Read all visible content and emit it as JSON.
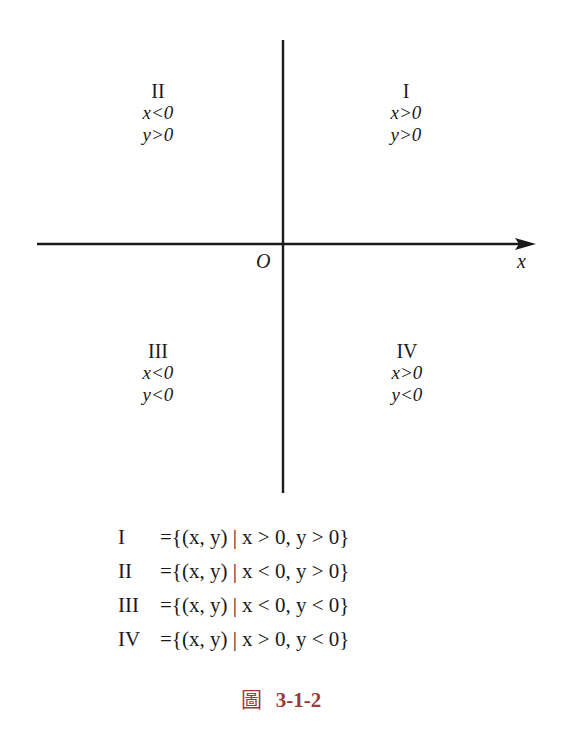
{
  "figure": {
    "origin_label": "O",
    "x_axis_label": "x",
    "quadrants": {
      "I": {
        "roman": "I",
        "x_cond": "x>0",
        "y_cond": "y>0"
      },
      "II": {
        "roman": "II",
        "x_cond": "x<0",
        "y_cond": "y>0"
      },
      "III": {
        "roman": "III",
        "x_cond": "x<0",
        "y_cond": "y<0"
      },
      "IV": {
        "roman": "IV",
        "x_cond": "x>0",
        "y_cond": "y<0"
      }
    },
    "set_definitions": [
      {
        "roman": "I",
        "expr": "={(x,  y) | x > 0,  y > 0}"
      },
      {
        "roman": "II",
        "expr": "={(x,  y) | x < 0,  y > 0}"
      },
      {
        "roman": "III",
        "expr": "={(x,  y) | x < 0,  y < 0}"
      },
      {
        "roman": "IV",
        "expr": "={(x,  y) | x > 0,  y < 0}"
      }
    ],
    "caption": {
      "prefix": "圖",
      "number": "3-1-2",
      "color": "#9b3a3a"
    }
  }
}
